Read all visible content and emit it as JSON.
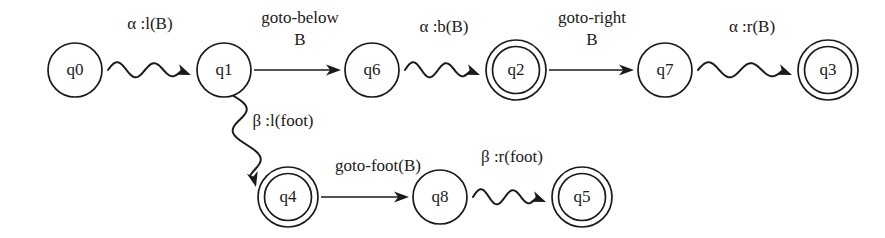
{
  "diagram": {
    "type": "finite-state-automaton",
    "width": 885,
    "height": 238,
    "background_color": "#ffffff",
    "ink_color": "#1a1a1a",
    "states": [
      {
        "id": "q0",
        "label": "q0",
        "accepting": false,
        "cx": 75,
        "cy": 70,
        "r": 27
      },
      {
        "id": "q1",
        "label": "q1",
        "accepting": false,
        "cx": 224,
        "cy": 70,
        "r": 27
      },
      {
        "id": "q6",
        "label": "q6",
        "accepting": false,
        "cx": 372,
        "cy": 70,
        "r": 27
      },
      {
        "id": "q2",
        "label": "q2",
        "accepting": true,
        "cx": 516,
        "cy": 70,
        "r": 30
      },
      {
        "id": "q7",
        "label": "q7",
        "accepting": false,
        "cx": 665,
        "cy": 70,
        "r": 27
      },
      {
        "id": "q3",
        "label": "q3",
        "accepting": true,
        "cx": 828,
        "cy": 70,
        "r": 30
      },
      {
        "id": "q4",
        "label": "q4",
        "accepting": true,
        "cx": 288,
        "cy": 197,
        "r": 30
      },
      {
        "id": "q8",
        "label": "q8",
        "accepting": false,
        "cx": 440,
        "cy": 197,
        "r": 27
      },
      {
        "id": "q5",
        "label": "q5",
        "accepting": true,
        "cx": 582,
        "cy": 197,
        "r": 30
      }
    ],
    "transitions": [
      {
        "id": "t-q0-q1",
        "from": "q0",
        "to": "q1",
        "style": "wavy",
        "label_lines": [
          "α :l(B)"
        ],
        "label_x": 150,
        "label_y": 25
      },
      {
        "id": "t-q1-q6",
        "from": "q1",
        "to": "q6",
        "style": "straight",
        "label_lines": [
          "goto-below",
          "B"
        ],
        "label_x": 300,
        "label_y": 19
      },
      {
        "id": "t-q6-q2",
        "from": "q6",
        "to": "q2",
        "style": "wavy",
        "label_lines": [
          "α :b(B)"
        ],
        "label_x": 444,
        "label_y": 28
      },
      {
        "id": "t-q2-q7",
        "from": "q2",
        "to": "q7",
        "style": "straight",
        "label_lines": [
          "goto-right",
          "B"
        ],
        "label_x": 592,
        "label_y": 19
      },
      {
        "id": "t-q7-q3",
        "from": "q7",
        "to": "q3",
        "style": "wavy",
        "label_lines": [
          "α :r(B)"
        ],
        "label_x": 752,
        "label_y": 28
      },
      {
        "id": "t-q1-q4",
        "from": "q1",
        "to": "q4",
        "style": "wavy-down",
        "label_lines": [
          "β :l(foot)"
        ],
        "label_x": 283,
        "label_y": 122
      },
      {
        "id": "t-q4-q8",
        "from": "q4",
        "to": "q8",
        "style": "straight",
        "label_lines": [
          "goto-foot(B)"
        ],
        "label_x": 378,
        "label_y": 167
      },
      {
        "id": "t-q8-q5",
        "from": "q8",
        "to": "q5",
        "style": "wavy",
        "label_lines": [
          "β :r(foot)"
        ],
        "label_x": 512,
        "label_y": 158
      }
    ]
  }
}
